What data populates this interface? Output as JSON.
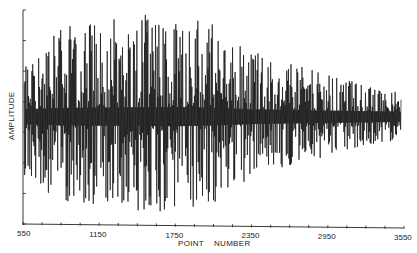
{
  "chart_data": {
    "type": "line",
    "title": "",
    "xlabel": "POINT     NUMBER",
    "ylabel": "AMPLITUDE",
    "xlim": [
      550,
      3550
    ],
    "x_ticks": [
      550,
      1150,
      1750,
      2350,
      2950,
      3550
    ],
    "x_tick_labels": [
      "550",
      "1150",
      "1750",
      "2350",
      "2950",
      "3550"
    ],
    "x_minor_tick_step": 150,
    "y_ticks_labeled": false,
    "y_tick_count": 8,
    "grid": false,
    "legend": null,
    "series": [
      {
        "name": "signal",
        "description": "Dense oscillating waveform centered on zero; large envelope from ~550 to ~2300, decaying amplitude toward 3550",
        "envelope_x": [
          550,
          850,
          1150,
          1450,
          1750,
          2050,
          2350,
          2650,
          2950,
          3250,
          3550
        ],
        "envelope_rel_amplitude": [
          0.62,
          0.85,
          0.9,
          0.95,
          1.0,
          0.88,
          0.62,
          0.5,
          0.4,
          0.3,
          0.22
        ]
      }
    ],
    "color": "#111111"
  },
  "axes": {
    "y_label": "AMPLITUDE",
    "x_label_left": "POINT",
    "x_label_right": "NUMBER"
  }
}
